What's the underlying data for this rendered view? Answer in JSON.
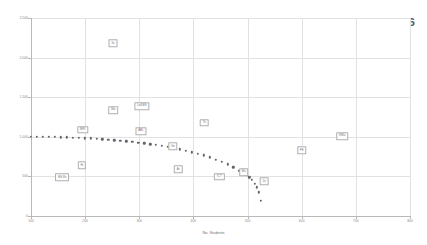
{
  "chart_data": {
    "type": "scatter",
    "title": "Staff Workload 2015-2016",
    "xlabel": "No. Students",
    "ylabel": "Sum of No. Students x Periods Taught",
    "xlim": [
      100,
      800
    ],
    "ylim": [
      0,
      2500
    ],
    "xticks": [
      "100",
      "200",
      "300",
      "400",
      "500",
      "600",
      "700",
      "800"
    ],
    "yticks": [
      "0",
      "500",
      "1,000",
      "1,500",
      "2,000",
      "2,500"
    ],
    "grid": true,
    "legend": "none",
    "series": [
      {
        "name": "Staff data points",
        "points": [
          {
            "label": "Sc",
            "x": 252,
            "y": 2180
          },
          {
            "label": "Ma",
            "x": 252,
            "y": 1340
          },
          {
            "label": "LwDES",
            "x": 305,
            "y": 1390
          },
          {
            "label": "MFL",
            "x": 196,
            "y": 1090
          },
          {
            "label": "ABL",
            "x": 303,
            "y": 1075
          },
          {
            "label": "Te",
            "x": 420,
            "y": 1180
          },
          {
            "label": "EMa",
            "x": 675,
            "y": 1010
          },
          {
            "label": "PE",
            "x": 600,
            "y": 830
          },
          {
            "label": "Hi",
            "x": 194,
            "y": 640
          },
          {
            "label": "Ge",
            "x": 362,
            "y": 880
          },
          {
            "label": "Ar",
            "x": 372,
            "y": 590
          },
          {
            "label": "ICT",
            "x": 448,
            "y": 495
          },
          {
            "label": "Mu",
            "x": 493,
            "y": 555
          },
          {
            "label": "Dr",
            "x": 531,
            "y": 440
          },
          {
            "label": "BS-Rs",
            "x": 158,
            "y": 490
          }
        ]
      },
      {
        "name": "Trend curve",
        "style": "dotted",
        "curve_points": [
          {
            "x": 100,
            "y": 1002
          },
          {
            "x": 111,
            "y": 1001
          },
          {
            "x": 122,
            "y": 1000
          },
          {
            "x": 133,
            "y": 999
          },
          {
            "x": 144,
            "y": 997
          },
          {
            "x": 155,
            "y": 995
          },
          {
            "x": 166,
            "y": 993
          },
          {
            "x": 177,
            "y": 990
          },
          {
            "x": 188,
            "y": 987
          },
          {
            "x": 199,
            "y": 983
          },
          {
            "x": 210,
            "y": 979
          },
          {
            "x": 221,
            "y": 975
          },
          {
            "x": 232,
            "y": 970
          },
          {
            "x": 243,
            "y": 964
          },
          {
            "x": 254,
            "y": 958
          },
          {
            "x": 265,
            "y": 951
          },
          {
            "x": 276,
            "y": 944
          },
          {
            "x": 287,
            "y": 936
          },
          {
            "x": 298,
            "y": 927
          },
          {
            "x": 309,
            "y": 918
          },
          {
            "x": 320,
            "y": 907
          },
          {
            "x": 331,
            "y": 896
          },
          {
            "x": 342,
            "y": 884
          },
          {
            "x": 353,
            "y": 871
          },
          {
            "x": 364,
            "y": 857
          },
          {
            "x": 375,
            "y": 841
          },
          {
            "x": 386,
            "y": 824
          },
          {
            "x": 397,
            "y": 806
          },
          {
            "x": 408,
            "y": 786
          },
          {
            "x": 419,
            "y": 764
          },
          {
            "x": 430,
            "y": 740
          },
          {
            "x": 441,
            "y": 713
          },
          {
            "x": 452,
            "y": 684
          },
          {
            "x": 463,
            "y": 651
          },
          {
            "x": 474,
            "y": 614
          },
          {
            "x": 485,
            "y": 572
          },
          {
            "x": 496,
            "y": 524
          },
          {
            "x": 503,
            "y": 489
          },
          {
            "x": 508,
            "y": 455
          },
          {
            "x": 513,
            "y": 410
          },
          {
            "x": 517,
            "y": 360
          },
          {
            "x": 521,
            "y": 300
          },
          {
            "x": 524,
            "y": 190
          }
        ]
      }
    ]
  }
}
